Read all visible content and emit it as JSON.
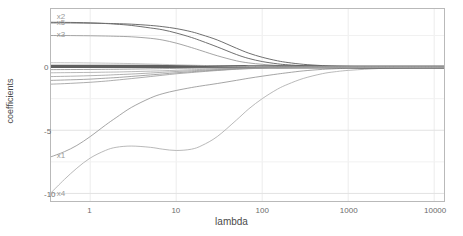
{
  "chart_data": {
    "type": "line",
    "title": "",
    "xlabel": "lambda",
    "ylabel": "coefficients",
    "xscale": "log",
    "xlim": [
      0.35,
      13000
    ],
    "ylim": [
      -10.6,
      4.6
    ],
    "grid": true,
    "legend_position": "inline-labels-left",
    "xticks": [
      {
        "value": 1,
        "label": "1"
      },
      {
        "value": 10,
        "label": "10"
      },
      {
        "value": 100,
        "label": "100"
      },
      {
        "value": 1000,
        "label": "1000"
      },
      {
        "value": 10000,
        "label": "10000"
      }
    ],
    "yticks": [
      {
        "value": 0,
        "label": "0"
      },
      {
        "value": -5,
        "label": "-5"
      },
      {
        "value": -10,
        "label": "-10"
      }
    ],
    "x": [
      0.35,
      0.5,
      0.7,
      1,
      1.5,
      2,
      3,
      5,
      7,
      10,
      15,
      20,
      30,
      50,
      70,
      100,
      150,
      200,
      300,
      500,
      700,
      1000,
      2000,
      3000,
      5000,
      10000,
      13000
    ],
    "series": [
      {
        "name": "x2",
        "label": "x2",
        "label_x": 0.42,
        "label_y": 3.9,
        "color": "#6e6e6e",
        "width": 1.0,
        "values": [
          3.55,
          3.54,
          3.53,
          3.5,
          3.45,
          3.4,
          3.3,
          3.1,
          2.95,
          2.7,
          2.35,
          2.05,
          1.6,
          1.0,
          0.68,
          0.44,
          0.26,
          0.18,
          0.11,
          0.06,
          0.04,
          0.03,
          0.015,
          0.01,
          0.005,
          0.002,
          0.001
        ]
      },
      {
        "name": "x5",
        "label": "x5",
        "label_x": 0.42,
        "label_y": 3.45,
        "color": "#6e6e6e",
        "width": 1.0,
        "values": [
          3.5,
          3.5,
          3.49,
          3.48,
          3.46,
          3.44,
          3.4,
          3.3,
          3.2,
          3.05,
          2.8,
          2.55,
          2.15,
          1.5,
          1.1,
          0.78,
          0.5,
          0.36,
          0.22,
          0.12,
          0.08,
          0.055,
          0.028,
          0.018,
          0.01,
          0.004,
          0.002
        ]
      },
      {
        "name": "x3",
        "label": "x3",
        "label_x": 0.42,
        "label_y": 2.45,
        "color": "#9a9a9a",
        "width": 0.9,
        "values": [
          2.5,
          2.5,
          2.49,
          2.48,
          2.46,
          2.44,
          2.4,
          2.28,
          2.14,
          1.9,
          1.55,
          1.28,
          0.9,
          0.5,
          0.33,
          0.22,
          0.13,
          0.09,
          0.055,
          0.03,
          0.02,
          0.014,
          0.007,
          0.004,
          0.002,
          0.001,
          0.0005
        ]
      },
      {
        "name": "x1",
        "label": "x1",
        "label_x": 0.42,
        "label_y": -7.0,
        "color": "#9a9a9a",
        "width": 0.9,
        "values": [
          -7.1,
          -6.7,
          -6.2,
          -5.5,
          -4.6,
          -4.0,
          -3.2,
          -2.45,
          -2.1,
          -1.85,
          -1.62,
          -1.48,
          -1.3,
          -1.05,
          -0.88,
          -0.72,
          -0.55,
          -0.44,
          -0.3,
          -0.18,
          -0.13,
          -0.09,
          -0.045,
          -0.03,
          -0.018,
          -0.008,
          -0.005
        ]
      },
      {
        "name": "x4",
        "label": "x4",
        "label_x": 0.42,
        "label_y": -10.0,
        "color": "#b0b0b0",
        "width": 0.9,
        "values": [
          -9.95,
          -8.9,
          -8.0,
          -7.2,
          -6.6,
          -6.35,
          -6.25,
          -6.35,
          -6.5,
          -6.6,
          -6.5,
          -6.2,
          -5.5,
          -4.2,
          -3.3,
          -2.5,
          -1.75,
          -1.35,
          -0.9,
          -0.52,
          -0.37,
          -0.26,
          -0.13,
          -0.085,
          -0.05,
          -0.024,
          -0.015
        ]
      },
      {
        "name": "zero-band-thick",
        "label": "",
        "color": "#5f5f5f",
        "width": 3.2,
        "values": [
          0.06,
          0.06,
          0.06,
          0.06,
          0.06,
          0.06,
          0.06,
          0.06,
          0.05,
          0.05,
          0.05,
          0.05,
          0.04,
          0.04,
          0.03,
          0.03,
          0.02,
          0.02,
          0.015,
          0.01,
          0.008,
          0.006,
          0.003,
          0.002,
          0.001,
          0.0005,
          0.0003
        ]
      },
      {
        "name": "x6",
        "label": "",
        "color": "#a5a5a5",
        "width": 0.8,
        "values": [
          -0.45,
          -0.44,
          -0.43,
          -0.42,
          -0.4,
          -0.39,
          -0.36,
          -0.32,
          -0.29,
          -0.25,
          -0.21,
          -0.18,
          -0.14,
          -0.09,
          -0.07,
          -0.05,
          -0.033,
          -0.025,
          -0.016,
          -0.009,
          -0.006,
          -0.004,
          -0.002,
          -0.0012,
          -0.0007,
          -0.0003,
          -0.0002
        ]
      },
      {
        "name": "x7",
        "label": "",
        "color": "#9d9d9d",
        "width": 0.8,
        "values": [
          -0.75,
          -0.73,
          -0.71,
          -0.68,
          -0.64,
          -0.6,
          -0.55,
          -0.47,
          -0.41,
          -0.35,
          -0.29,
          -0.25,
          -0.19,
          -0.12,
          -0.09,
          -0.065,
          -0.043,
          -0.032,
          -0.02,
          -0.011,
          -0.008,
          -0.005,
          -0.0025,
          -0.0015,
          -0.0009,
          -0.0004,
          -0.0002
        ]
      },
      {
        "name": "x8",
        "label": "",
        "color": "#8f8f8f",
        "width": 0.8,
        "values": [
          -1.05,
          -1.02,
          -0.99,
          -0.95,
          -0.88,
          -0.83,
          -0.74,
          -0.62,
          -0.54,
          -0.45,
          -0.37,
          -0.31,
          -0.24,
          -0.15,
          -0.11,
          -0.08,
          -0.052,
          -0.039,
          -0.024,
          -0.013,
          -0.009,
          -0.006,
          -0.003,
          -0.0018,
          -0.001,
          -0.0005,
          -0.0003
        ]
      },
      {
        "name": "x9",
        "label": "",
        "color": "#979797",
        "width": 0.8,
        "values": [
          -1.35,
          -1.31,
          -1.26,
          -1.2,
          -1.11,
          -1.03,
          -0.91,
          -0.75,
          -0.64,
          -0.53,
          -0.43,
          -0.36,
          -0.27,
          -0.17,
          -0.125,
          -0.09,
          -0.058,
          -0.044,
          -0.027,
          -0.015,
          -0.01,
          -0.007,
          -0.0034,
          -0.002,
          -0.0012,
          -0.0006,
          -0.0003
        ]
      },
      {
        "name": "x10",
        "label": "",
        "color": "#8a8a8a",
        "width": 0.8,
        "values": [
          -0.2,
          -0.195,
          -0.19,
          -0.185,
          -0.175,
          -0.168,
          -0.155,
          -0.135,
          -0.12,
          -0.105,
          -0.088,
          -0.076,
          -0.059,
          -0.038,
          -0.028,
          -0.021,
          -0.014,
          -0.0105,
          -0.0066,
          -0.0037,
          -0.0026,
          -0.0018,
          -0.0009,
          -0.0005,
          -0.0003,
          -0.00015,
          -0.0001
        ]
      },
      {
        "name": "x11",
        "label": "",
        "color": "#b4b4b4",
        "width": 0.8,
        "values": [
          0.35,
          0.345,
          0.34,
          0.33,
          0.315,
          0.3,
          0.28,
          0.24,
          0.215,
          0.185,
          0.155,
          0.132,
          0.102,
          0.066,
          0.049,
          0.036,
          0.024,
          0.018,
          0.011,
          0.006,
          0.0043,
          0.003,
          0.0015,
          0.0009,
          0.0005,
          0.00025,
          0.00015
        ]
      }
    ]
  }
}
